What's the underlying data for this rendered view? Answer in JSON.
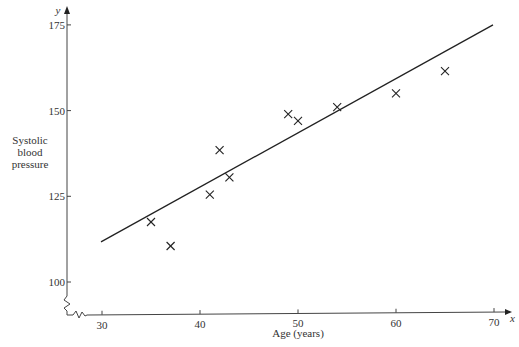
{
  "chart_data": {
    "type": "scatter",
    "title": "",
    "xlabel": "Age (years)",
    "ylabel": "Systolic blood pressure",
    "ylabel_lines": [
      "Systolic",
      "blood",
      "pressure"
    ],
    "x_axis_var": "x",
    "y_axis_var": "y",
    "xlim": [
      30,
      70
    ],
    "ylim": [
      100,
      175
    ],
    "x_ticks": [
      30,
      40,
      50,
      60,
      70
    ],
    "y_ticks": [
      100,
      125,
      150,
      175
    ],
    "grid": false,
    "axis_break": true,
    "marker": "x",
    "series": [
      {
        "name": "observations",
        "points": [
          {
            "x": 35,
            "y": 117.5
          },
          {
            "x": 37,
            "y": 110.5
          },
          {
            "x": 41,
            "y": 125.5
          },
          {
            "x": 42,
            "y": 138.5
          },
          {
            "x": 43,
            "y": 130.5
          },
          {
            "x": 49,
            "y": 149
          },
          {
            "x": 50,
            "y": 147
          },
          {
            "x": 54,
            "y": 151
          },
          {
            "x": 60,
            "y": 155
          },
          {
            "x": 65,
            "y": 161.5
          }
        ]
      }
    ],
    "regression_line": {
      "x1": 30,
      "y1": 112,
      "x2": 70,
      "y2": 175
    }
  },
  "colors": {
    "ink": "#222222",
    "axis": "#444444",
    "text": "#333333",
    "background": "#ffffff"
  }
}
